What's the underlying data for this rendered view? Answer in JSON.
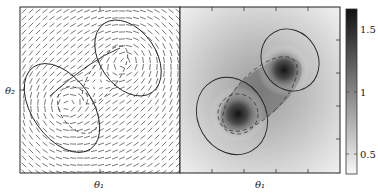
{
  "figure": {
    "left_panel": {
      "xlabel": "θ₁",
      "ylabel": "θ₂",
      "content": "vector field (quiver) with solid and dashed contours"
    },
    "right_panel": {
      "xlabel": "θ₁",
      "content": "grayscale density heatmap with two dark modes, solid and dashed contours"
    },
    "colorbar": {
      "ticks": [
        "1.5",
        "1",
        "0.5"
      ],
      "tick_values": [
        1.5,
        1.0,
        0.5
      ],
      "range": [
        0.3,
        1.7
      ],
      "colormap": "gray_r"
    }
  },
  "chart_data": [
    {
      "type": "quiver",
      "title": "",
      "xlabel": "θ₁",
      "ylabel": "θ₂",
      "grid": false,
      "annotations": [
        "solid contours around two modes",
        "dashed inner contours"
      ]
    },
    {
      "type": "heatmap",
      "title": "",
      "xlabel": "θ₁",
      "ylabel": "",
      "modes": [
        {
          "x": 0.33,
          "y": 0.63
        },
        {
          "x": 0.65,
          "y": 0.38
        }
      ],
      "colorbar": {
        "ticks": [
          0.5,
          1,
          1.5
        ],
        "range": [
          0.3,
          1.7
        ]
      }
    }
  ]
}
